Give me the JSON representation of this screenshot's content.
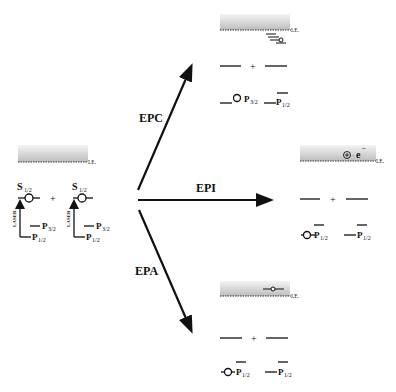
{
  "diagram": {
    "type": "energy-level-process-diagram",
    "initial_state": {
      "ie_label": "I.E.",
      "atom1": {
        "upper": "S",
        "upper_sub": "1/2",
        "lower1": "P",
        "lower1_sub": "3/2",
        "lower2": "P",
        "lower2_sub": "1/2",
        "excitation_label": "LASER"
      },
      "plus": "+",
      "atom2": {
        "upper": "S",
        "upper_sub": "1/2",
        "lower1": "P",
        "lower1_sub": "3/2",
        "lower2": "P",
        "lower2_sub": "1/2",
        "excitation_label": "LASER"
      }
    },
    "processes": [
      {
        "name": "EPC",
        "direction": "up"
      },
      {
        "name": "EPI",
        "direction": "right"
      },
      {
        "name": "EPA",
        "direction": "down"
      }
    ],
    "epc_panel": {
      "ie_label": "I.E.",
      "plus": "+",
      "level1": "P",
      "level1_sub": "3/2",
      "level2": "P",
      "level2_sub": "1/2"
    },
    "epi_panel": {
      "ie_label": "I.E.",
      "ion_symbol": "⊕",
      "electron": "e",
      "electron_sup": "−",
      "plus": "+",
      "level1": "P",
      "level1_sub": "1/2",
      "level2": "P",
      "level2_sub": "1/2"
    },
    "epa_panel": {
      "ie_label": "I.E.",
      "plus": "+",
      "level1": "P",
      "level1_sub": "1/2",
      "level2": "P",
      "level2_sub": "1/2"
    }
  }
}
